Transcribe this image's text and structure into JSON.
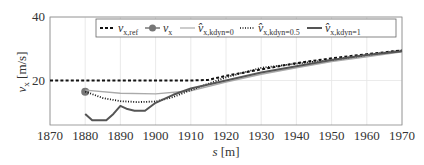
{
  "chart_data": {
    "type": "line",
    "title": "",
    "xlabel": "s [m]",
    "ylabel": "v_x [m/s]",
    "xlim": [
      1870,
      1970
    ],
    "ylim": [
      6,
      40
    ],
    "xticks": [
      1870,
      1880,
      1890,
      1900,
      1910,
      1920,
      1930,
      1940,
      1950,
      1960,
      1970
    ],
    "yticks": [
      20,
      40
    ],
    "grid": true,
    "legend_position": "top, inside, horizontal",
    "series": [
      {
        "name": "v_x,ref",
        "style": "dashed",
        "color": "#111111",
        "x": [
          1870,
          1880,
          1890,
          1900,
          1910,
          1915,
          1920,
          1930,
          1940,
          1950,
          1960,
          1970
        ],
        "y": [
          20,
          20,
          20,
          20,
          20,
          20.2,
          21.5,
          23.5,
          25.5,
          27,
          28.3,
          29.5
        ]
      },
      {
        "name": "v_x",
        "style": "marker",
        "color": "#777777",
        "x": [
          1880
        ],
        "y": [
          16.5
        ]
      },
      {
        "name": "v̂_x,kdyn=0",
        "style": "solid-thin",
        "color": "#aaaaaa",
        "x": [
          1880,
          1890,
          1900,
          1910,
          1920,
          1930,
          1940,
          1950,
          1960,
          1970
        ],
        "y": [
          17,
          16,
          15.8,
          16.8,
          19.5,
          22,
          24,
          26,
          27.5,
          29
        ]
      },
      {
        "name": "v̂_x,kdyn=0.5",
        "style": "dotted",
        "color": "#111111",
        "x": [
          1880,
          1885,
          1890,
          1895,
          1900,
          1905,
          1910,
          1920,
          1930,
          1940,
          1950,
          1960,
          1970
        ],
        "y": [
          16.5,
          14.5,
          13.5,
          13.2,
          13.4,
          14.8,
          17,
          21,
          24,
          25.3,
          26.5,
          28,
          29.5
        ]
      },
      {
        "name": "v̂_x,kdyn=1",
        "style": "solid-thick",
        "color": "#555555",
        "x": [
          1880,
          1882,
          1886,
          1888,
          1890,
          1892,
          1894,
          1897,
          1900,
          1905,
          1910,
          1920,
          1930,
          1940,
          1950,
          1960,
          1970
        ],
        "y": [
          9.5,
          7.5,
          7.5,
          9.5,
          12,
          11,
          10.5,
          10.5,
          13,
          15.5,
          17.5,
          20,
          22.5,
          24.5,
          26.5,
          28,
          29.2
        ]
      }
    ]
  },
  "legend": {
    "items": [
      "v_x,ref",
      "v_x",
      "v̂_x,kdyn=0",
      "v̂_x,kdyn=0.5",
      "v̂_x,kdyn=1"
    ]
  }
}
